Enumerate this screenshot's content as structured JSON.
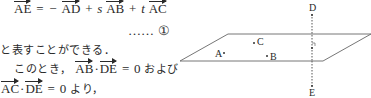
{
  "equation1": {
    "lhs": "AE",
    "equals": "=",
    "minus": "−",
    "term1": "AD",
    "plus1": "+",
    "coef_s": "s",
    "term2": "AB",
    "plus2": "+",
    "coef_t": "t",
    "term3": "AC"
  },
  "equation_label": {
    "dots": "……",
    "number": "①"
  },
  "text_line3": "と表すことができる．",
  "text_line4": {
    "prefix": "このとき，",
    "vec1": "AB",
    "dot": "·",
    "vec2": "DE",
    "equals": "=",
    "zero": "0",
    "suffix": "および"
  },
  "text_line5": {
    "vec1": "AC",
    "dot": "·",
    "vec2": "DE",
    "equals": "=",
    "zero": "0",
    "suffix": "より，"
  },
  "diagram": {
    "points": {
      "A": "A",
      "B": "B",
      "C": "C",
      "D": "D",
      "E": "E"
    },
    "right_angle_mark": "⌐"
  }
}
